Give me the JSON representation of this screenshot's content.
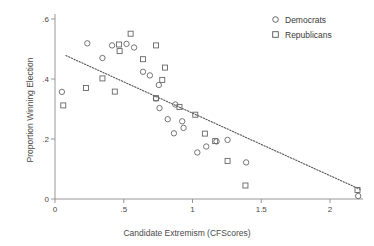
{
  "chart_data": {
    "type": "scatter",
    "title": "",
    "xlabel": "Candidate Extremism (CFScores)",
    "ylabel": "Proportion Winning Election",
    "xlim": [
      0,
      2.3
    ],
    "ylim": [
      0,
      0.6
    ],
    "xticks": [
      "0",
      ".5",
      "1",
      "1.5",
      "2"
    ],
    "xtick_values": [
      0,
      0.5,
      1,
      1.5,
      2
    ],
    "yticks": [
      "0",
      ".2",
      ".4",
      ".6"
    ],
    "ytick_values": [
      0,
      0.2,
      0.4,
      0.6
    ],
    "grid": false,
    "legend_position": "top-right",
    "marker_color": "#666666",
    "line_color": "#555555",
    "series": [
      {
        "name": "Democrats",
        "marker": "circle",
        "points": [
          [
            0.05,
            0.357
          ],
          [
            0.235,
            0.519
          ],
          [
            0.345,
            0.47
          ],
          [
            0.415,
            0.512
          ],
          [
            0.52,
            0.517
          ],
          [
            0.575,
            0.505
          ],
          [
            0.64,
            0.424
          ],
          [
            0.69,
            0.412
          ],
          [
            0.755,
            0.38
          ],
          [
            0.735,
            0.335
          ],
          [
            0.76,
            0.303
          ],
          [
            0.82,
            0.266
          ],
          [
            0.865,
            0.219
          ],
          [
            0.875,
            0.315
          ],
          [
            0.925,
            0.259
          ],
          [
            0.935,
            0.237
          ],
          [
            1.035,
            0.155
          ],
          [
            1.1,
            0.175
          ],
          [
            1.175,
            0.192
          ],
          [
            1.255,
            0.197
          ],
          [
            1.39,
            0.122
          ],
          [
            2.205,
            0.01
          ]
        ]
      },
      {
        "name": "Republicans",
        "marker": "square",
        "points": [
          [
            0.06,
            0.312
          ],
          [
            0.225,
            0.37
          ],
          [
            0.345,
            0.402
          ],
          [
            0.435,
            0.358
          ],
          [
            0.465,
            0.515
          ],
          [
            0.47,
            0.493
          ],
          [
            0.55,
            0.551
          ],
          [
            0.64,
            0.466
          ],
          [
            0.735,
            0.512
          ],
          [
            0.735,
            0.336
          ],
          [
            0.8,
            0.438
          ],
          [
            0.78,
            0.397
          ],
          [
            0.905,
            0.307
          ],
          [
            1.02,
            0.281
          ],
          [
            1.09,
            0.218
          ],
          [
            1.165,
            0.193
          ],
          [
            1.255,
            0.127
          ],
          [
            1.385,
            0.045
          ],
          [
            2.2,
            0.03
          ]
        ]
      }
    ],
    "trendline": {
      "style": "dotted",
      "x_start": 0.08,
      "y_start": 0.478,
      "x_end": 2.22,
      "y_end": 0.032
    }
  },
  "legend": {
    "items": [
      {
        "label": "Democrats",
        "marker": "circle"
      },
      {
        "label": "Republicans",
        "marker": "square"
      }
    ]
  }
}
